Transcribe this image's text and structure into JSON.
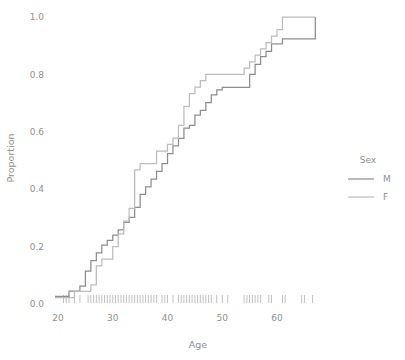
{
  "chart_data": {
    "type": "line",
    "subtype": "ecdf-step",
    "title": "",
    "xlabel": "Age",
    "ylabel": "Proportion",
    "xlim": [
      20,
      67
    ],
    "ylim": [
      0.0,
      1.0
    ],
    "grid": false,
    "xticks": [
      20,
      30,
      40,
      50,
      60
    ],
    "xtick_labels": [
      "20",
      "30",
      "40",
      "50",
      "60"
    ],
    "yticks": [
      0.0,
      0.2,
      0.4,
      0.6,
      0.8,
      1.0
    ],
    "ytick_labels": [
      "0.0",
      "0.2",
      "0.4",
      "0.6",
      "0.8",
      "1.0"
    ],
    "legend": {
      "title": "Sex",
      "position": "right",
      "entries": [
        {
          "label": "M",
          "color": "#8d8d8d"
        },
        {
          "label": "F",
          "color": "#bcbcbc"
        }
      ]
    },
    "series": [
      {
        "name": "M",
        "color": "#8d8d8d",
        "x": [
          21,
          22,
          24,
          25,
          26,
          27,
          28,
          29,
          30,
          31,
          32,
          33,
          34,
          35,
          36,
          37,
          38,
          39,
          40,
          41,
          42,
          43,
          44,
          45,
          46,
          47,
          48,
          49,
          50,
          51,
          54,
          55,
          56,
          57,
          58,
          59,
          61,
          65,
          67
        ],
        "y": [
          0.027,
          0.045,
          0.062,
          0.115,
          0.151,
          0.178,
          0.205,
          0.222,
          0.24,
          0.258,
          0.284,
          0.302,
          0.337,
          0.382,
          0.408,
          0.435,
          0.462,
          0.489,
          0.524,
          0.551,
          0.577,
          0.613,
          0.622,
          0.658,
          0.675,
          0.702,
          0.729,
          0.746,
          0.755,
          0.755,
          0.755,
          0.8,
          0.835,
          0.862,
          0.88,
          0.906,
          0.924,
          0.924,
          1.0
        ]
      },
      {
        "name": "F",
        "color": "#bcbcbc",
        "x": [
          21,
          23,
          26,
          27,
          28,
          30,
          31,
          32,
          33,
          34,
          35,
          38,
          40,
          41,
          42,
          43,
          44,
          45,
          46,
          47,
          48,
          49,
          50,
          54,
          55,
          56,
          57,
          58,
          59,
          60,
          61,
          67
        ],
        "y": [
          0.022,
          0.044,
          0.067,
          0.133,
          0.156,
          0.2,
          0.244,
          0.289,
          0.333,
          0.467,
          0.489,
          0.533,
          0.556,
          0.578,
          0.622,
          0.689,
          0.733,
          0.756,
          0.778,
          0.8,
          0.8,
          0.8,
          0.8,
          0.822,
          0.844,
          0.867,
          0.889,
          0.911,
          0.933,
          0.956,
          1.0,
          1.0
        ]
      }
    ],
    "rug": {
      "color": "#b9b9b9",
      "values": [
        21,
        21.5,
        22,
        23,
        24,
        25.5,
        26,
        26.5,
        27,
        27.5,
        28,
        28.5,
        29,
        29.5,
        30,
        30.5,
        31,
        31.5,
        32,
        32.5,
        33,
        33.5,
        34,
        34.5,
        35,
        35.5,
        36,
        36.5,
        37,
        37.5,
        38,
        39,
        39.5,
        40,
        41,
        42,
        42.5,
        43,
        43.5,
        44,
        44.5,
        45,
        45.5,
        46,
        46.5,
        47,
        47.5,
        48,
        49,
        50,
        51,
        54,
        54.5,
        55,
        55.5,
        56,
        56.5,
        57,
        58.5,
        59,
        61,
        61.5,
        64.5,
        65,
        66.5
      ]
    }
  }
}
